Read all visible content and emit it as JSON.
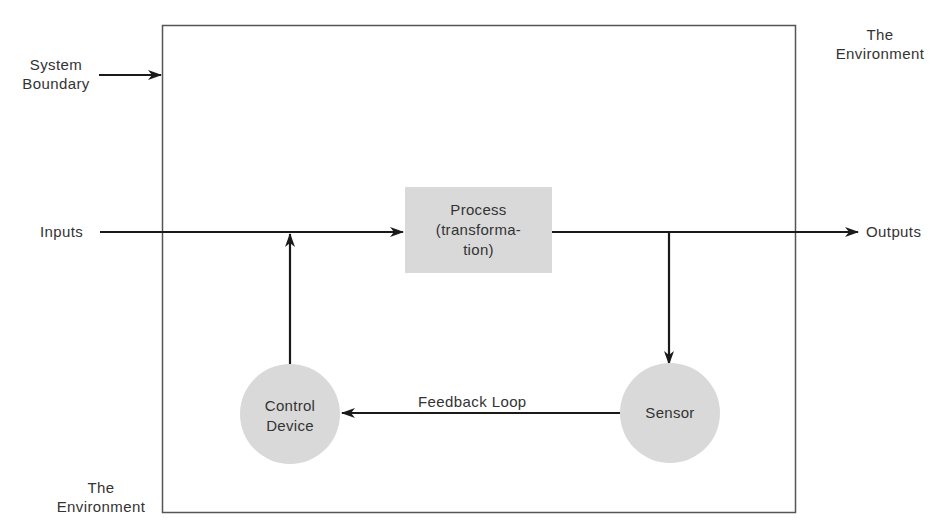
{
  "diagram": {
    "type": "systems-feedback-diagram",
    "labels": {
      "system_boundary": [
        "System",
        "Boundary"
      ],
      "environment_top": [
        "The",
        "Environment"
      ],
      "environment_bottom": [
        "The",
        "Environment"
      ],
      "inputs": "Inputs",
      "outputs": "Outputs",
      "feedback_loop": "Feedback Loop"
    },
    "nodes": {
      "process": {
        "lines": [
          "Process",
          "(transforma-",
          "tion)"
        ],
        "shape": "rectangle",
        "fill": "#d9d9d9"
      },
      "control_device": {
        "lines": [
          "Control",
          "Device"
        ],
        "shape": "circle",
        "fill": "#d9d9d9"
      },
      "sensor": {
        "lines": [
          "Sensor"
        ],
        "shape": "circle",
        "fill": "#d9d9d9"
      }
    },
    "edges": [
      {
        "from": "inputs",
        "to": "process"
      },
      {
        "from": "process",
        "to": "outputs"
      },
      {
        "from": "process-output-line",
        "to": "sensor"
      },
      {
        "from": "sensor",
        "to": "control_device",
        "label": "Feedback Loop"
      },
      {
        "from": "control_device",
        "to": "input-line"
      }
    ],
    "colors": {
      "line": "#1a1a1a",
      "boundary": "#555555",
      "node_fill": "#d9d9d9"
    }
  }
}
